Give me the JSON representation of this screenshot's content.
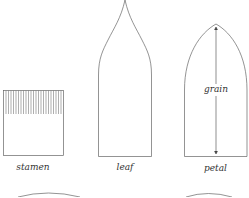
{
  "diagram": {
    "pieces": [
      {
        "name": "stamen",
        "label": "stamen",
        "shape": "rectangle with fringed top"
      },
      {
        "name": "leaf",
        "label": "leaf",
        "shape": "pointed ogee-tipped piece"
      },
      {
        "name": "petal",
        "label": "petal",
        "shape": "rounded pointed arch",
        "inner_label": "grain"
      }
    ],
    "partial_pieces_bottom": 2,
    "stroke_color": "#555555",
    "label_color": "#333333"
  }
}
